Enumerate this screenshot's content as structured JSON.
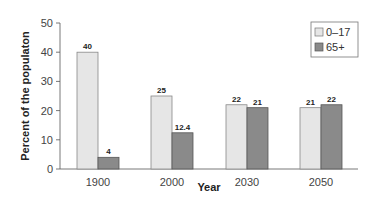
{
  "chart_data": {
    "type": "bar",
    "title": "",
    "xlabel": "Year",
    "ylabel": "Percent of the populaton",
    "ylim": [
      0,
      50
    ],
    "yticks": [
      0,
      10,
      20,
      30,
      40,
      50
    ],
    "grid": false,
    "legend_position": "top-right",
    "categories": [
      "1900",
      "2000",
      "2030",
      "2050"
    ],
    "series": [
      {
        "name": "0–17",
        "color": "#e6e6e6",
        "values": [
          40,
          25,
          22,
          21
        ],
        "labels": [
          "40",
          "25",
          "22",
          "21"
        ]
      },
      {
        "name": "65+",
        "color": "#8a8a8a",
        "values": [
          4,
          12.4,
          21,
          22
        ],
        "labels": [
          "4",
          "12.4",
          "21",
          "22"
        ]
      }
    ]
  }
}
